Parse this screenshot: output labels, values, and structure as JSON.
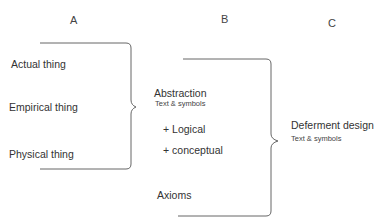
{
  "headers": {
    "a": "A",
    "b": "B",
    "c": "C"
  },
  "column_a": {
    "items": [
      "Actual thing",
      "Empirical thing",
      "Physical thing"
    ]
  },
  "column_b": {
    "title": "Abstraction",
    "subtitle": "Text & symbols",
    "items": [
      "+ Logical",
      "+ conceptual"
    ],
    "footer": "Axioms"
  },
  "column_c": {
    "title": "Deferment design",
    "subtitle": "Text & symbols"
  },
  "colors": {
    "line": "#666666",
    "text": "#333333"
  }
}
